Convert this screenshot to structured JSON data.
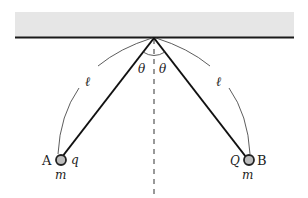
{
  "diagram": {
    "ceiling": {
      "fill": "#e6e6e6",
      "line_color": "#1a1a1a"
    },
    "angle_labels": {
      "left": "θ",
      "right": "θ"
    },
    "length_labels": {
      "left": "ℓ",
      "right": "ℓ"
    },
    "ball_a": {
      "name": "A",
      "charge": "q",
      "mass": "m",
      "fill": "#bdbdbd"
    },
    "ball_b": {
      "name": "B",
      "charge": "Q",
      "mass": "m",
      "fill": "#bdbdbd"
    }
  }
}
